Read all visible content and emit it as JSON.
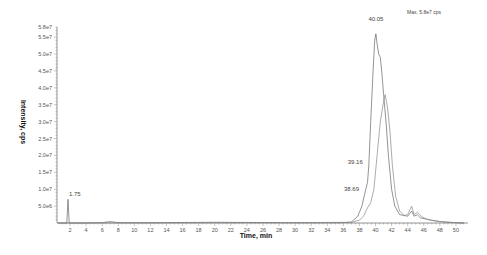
{
  "chart_data": {
    "type": "line",
    "title": "",
    "annotation_max": "Max. 5.8e7 cps",
    "xlabel": "Time, min",
    "ylabel": "Intensity, cps",
    "xlim": [
      0,
      52
    ],
    "ylim": [
      0,
      58000000
    ],
    "grid": false,
    "legend": null,
    "x_ticks": [
      2,
      4,
      6,
      8,
      10,
      12,
      14,
      16,
      18,
      20,
      22,
      24,
      26,
      28,
      30,
      32,
      34,
      36,
      38,
      40,
      42,
      44,
      46,
      48,
      50
    ],
    "x_tick_labels": [
      "2",
      "4",
      "6",
      "8",
      "10",
      "12",
      "14",
      "16",
      "18",
      "20",
      "22",
      "24",
      "26",
      "28",
      "30",
      "32",
      "34",
      "36",
      "38",
      "40",
      "42",
      "44",
      "46",
      "48",
      "50"
    ],
    "y_ticks": [
      5000000,
      10000000,
      15000000,
      20000000,
      25000000,
      30000000,
      35000000,
      40000000,
      45000000,
      50000000,
      55000000,
      58000000
    ],
    "y_tick_labels": [
      "5.0e6",
      "1.0e7",
      "1.5e7",
      "2.0e7",
      "2.5e7",
      "3.0e7",
      "3.5e7",
      "4.0e7",
      "4.5e7",
      "5.0e7",
      "5.5e7",
      "5.8e7"
    ],
    "peak_labels": [
      {
        "time": 1.75,
        "label": "1.75",
        "intensity": 7000000
      },
      {
        "time": 38.69,
        "label": "38.69",
        "intensity": 9000000
      },
      {
        "time": 39.16,
        "label": "39.16",
        "intensity": 17000000
      },
      {
        "time": 40.05,
        "label": "40.05",
        "intensity": 56000000
      }
    ],
    "series": [
      {
        "name": "trace-1",
        "x": [
          0.5,
          1.6,
          1.75,
          1.9,
          3,
          6,
          7,
          8,
          12,
          20,
          30,
          36,
          37,
          37.8,
          38.3,
          38.69,
          39.0,
          39.16,
          39.4,
          39.7,
          39.9,
          40.05,
          40.2,
          40.4,
          40.6,
          40.8,
          41.0,
          41.3,
          41.6,
          42.0,
          42.4,
          43.0,
          44.0,
          44.5,
          44.8,
          45.2,
          45.6,
          46.2,
          47.0,
          48.0,
          50.0,
          51.0
        ],
        "y": [
          0,
          0,
          7000000,
          0,
          0,
          100000,
          400000,
          100000,
          100000,
          200000,
          100000,
          100000,
          300000,
          2000000,
          5000000,
          9000000,
          12000000,
          17000000,
          30000000,
          45000000,
          54000000,
          56000000,
          53000000,
          50000000,
          49000000,
          44000000,
          38000000,
          30000000,
          20000000,
          10000000,
          5000000,
          2500000,
          2000000,
          3500000,
          2000000,
          2500000,
          1500000,
          1200000,
          800000,
          400000,
          100000,
          0
        ]
      },
      {
        "name": "trace-2",
        "x": [
          0.5,
          30,
          37.0,
          38.0,
          38.5,
          39.0,
          39.4,
          39.8,
          40.2,
          40.6,
          41.0,
          41.2,
          41.5,
          41.8,
          42.1,
          42.5,
          43.0,
          43.6,
          44.0,
          44.5,
          44.8,
          45.2,
          45.8,
          46.5,
          47.5,
          49.0,
          51.0
        ],
        "y": [
          0,
          100000,
          200000,
          800000,
          2000000,
          4500000,
          6000000,
          10000000,
          20000000,
          30000000,
          36000000,
          38000000,
          34000000,
          27000000,
          17000000,
          8000000,
          3500000,
          2200000,
          2500000,
          5000000,
          2500000,
          3200000,
          1800000,
          1000000,
          600000,
          200000,
          0
        ]
      }
    ]
  }
}
